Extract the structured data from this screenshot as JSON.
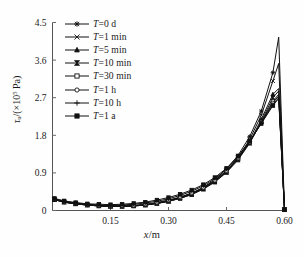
{
  "figure": {
    "background": "#fefefe",
    "ink_color": "#111111",
    "axis_color": "#555555"
  },
  "axes": {
    "x_title_var": "x",
    "x_title_unit": "/m",
    "y_title_var": "τ",
    "y_title_sub": "u",
    "y_title_unit": "/(×10",
    "y_title_exp": "5",
    "y_title_tail": " Pa)"
  },
  "legend": {
    "var_symbol": "T",
    "entries": [
      {
        "label": "T=0 d",
        "value_text": "0 d",
        "marker": "star-cross",
        "marker_name": "marker-star-cross"
      },
      {
        "label": "T=1 min",
        "value_text": "1 min",
        "marker": "cross-bar",
        "marker_name": "marker-cross-bar"
      },
      {
        "label": "T=5 min",
        "value_text": "5 min",
        "marker": "triangle-up",
        "marker_name": "marker-triangle-up"
      },
      {
        "label": "T=10 min",
        "value_text": "10 min",
        "marker": "bowtie",
        "marker_name": "marker-bowtie"
      },
      {
        "label": "T=30 min",
        "value_text": "30 min",
        "marker": "square-open",
        "marker_name": "marker-square-open"
      },
      {
        "label": "T=1 h",
        "value_text": "1 h",
        "marker": "circle-open",
        "marker_name": "marker-circle-open"
      },
      {
        "label": "T=10 h",
        "value_text": "10 h",
        "marker": "plus",
        "marker_name": "marker-plus"
      },
      {
        "label": "T=1 a",
        "value_text": "1 a",
        "marker": "square-filled",
        "marker_name": "marker-square-filled"
      }
    ]
  },
  "chart_data": {
    "type": "line",
    "title": "",
    "subtitle": "",
    "xlabel": "x/m",
    "ylabel": "τu/(×10^5 Pa)",
    "xlim": [
      0.0,
      0.6
    ],
    "ylim": [
      0.0,
      4.5
    ],
    "xticks": [
      0.15,
      0.3,
      0.45,
      0.6
    ],
    "xticklabels": [
      "0.15",
      "0.30",
      "0.45",
      "0.60"
    ],
    "yticks": [
      0,
      0.9,
      1.8,
      2.7,
      3.6,
      4.5
    ],
    "yticklabels": [
      "0",
      "0.9",
      "1.8",
      "2.7",
      "3.6",
      "4.5"
    ],
    "grid": false,
    "legend_position": "upper-left-inside",
    "x": [
      0.005,
      0.03,
      0.06,
      0.09,
      0.12,
      0.15,
      0.18,
      0.21,
      0.24,
      0.27,
      0.3,
      0.33,
      0.36,
      0.39,
      0.42,
      0.45,
      0.48,
      0.51,
      0.54,
      0.57,
      0.585,
      0.6
    ],
    "series": [
      {
        "name": "T=0 d",
        "marker": "star-cross",
        "values": [
          0.26,
          0.2,
          0.16,
          0.13,
          0.11,
          0.1,
          0.1,
          0.11,
          0.13,
          0.17,
          0.23,
          0.31,
          0.41,
          0.55,
          0.74,
          0.99,
          1.32,
          1.77,
          2.38,
          3.3,
          4.15,
          0.02
        ]
      },
      {
        "name": "T=1 min",
        "marker": "cross-bar",
        "values": [
          0.26,
          0.2,
          0.16,
          0.13,
          0.11,
          0.1,
          0.1,
          0.11,
          0.13,
          0.17,
          0.22,
          0.3,
          0.4,
          0.53,
          0.71,
          0.95,
          1.27,
          1.7,
          2.28,
          3.1,
          3.52,
          0.02
        ]
      },
      {
        "name": "T=5 min",
        "marker": "triangle-up",
        "values": [
          0.26,
          0.2,
          0.16,
          0.13,
          0.11,
          0.1,
          0.1,
          0.11,
          0.13,
          0.17,
          0.22,
          0.29,
          0.39,
          0.52,
          0.69,
          0.92,
          1.23,
          1.64,
          2.18,
          2.78,
          2.92,
          0.02
        ]
      },
      {
        "name": "T=10 min",
        "marker": "bowtie",
        "values": [
          0.26,
          0.2,
          0.16,
          0.13,
          0.11,
          0.1,
          0.1,
          0.11,
          0.13,
          0.17,
          0.22,
          0.29,
          0.38,
          0.51,
          0.68,
          0.91,
          1.21,
          1.61,
          2.13,
          2.7,
          2.86,
          0.02
        ]
      },
      {
        "name": "T=30 min",
        "marker": "square-open",
        "values": [
          0.27,
          0.21,
          0.17,
          0.14,
          0.12,
          0.11,
          0.11,
          0.12,
          0.14,
          0.18,
          0.24,
          0.31,
          0.41,
          0.54,
          0.71,
          0.94,
          1.24,
          1.63,
          2.12,
          2.62,
          2.78,
          0.02
        ]
      },
      {
        "name": "T=1 h",
        "marker": "circle-open",
        "values": [
          0.27,
          0.21,
          0.17,
          0.14,
          0.12,
          0.11,
          0.11,
          0.12,
          0.15,
          0.19,
          0.25,
          0.32,
          0.42,
          0.55,
          0.72,
          0.95,
          1.25,
          1.63,
          2.1,
          2.58,
          2.74,
          0.02
        ]
      },
      {
        "name": "T=10 h",
        "marker": "plus",
        "values": [
          0.28,
          0.22,
          0.18,
          0.15,
          0.13,
          0.12,
          0.13,
          0.15,
          0.18,
          0.22,
          0.28,
          0.36,
          0.46,
          0.59,
          0.76,
          0.99,
          1.28,
          1.65,
          2.09,
          2.54,
          2.7,
          0.02
        ]
      },
      {
        "name": "T=1 a",
        "marker": "square-filled",
        "values": [
          0.29,
          0.23,
          0.19,
          0.16,
          0.15,
          0.14,
          0.15,
          0.17,
          0.2,
          0.25,
          0.31,
          0.39,
          0.49,
          0.62,
          0.79,
          1.01,
          1.3,
          1.66,
          2.08,
          2.51,
          2.68,
          0.02
        ]
      }
    ]
  }
}
